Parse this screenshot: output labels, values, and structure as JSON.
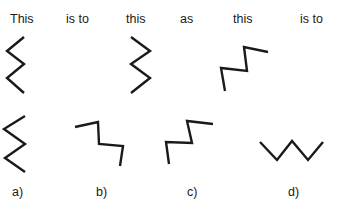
{
  "analogy": {
    "words": [
      "This",
      "is to",
      "this",
      "as",
      "this",
      "is to"
    ]
  },
  "options": [
    {
      "label": "a)"
    },
    {
      "label": "b)"
    },
    {
      "label": "c)"
    },
    {
      "label": "d)"
    }
  ],
  "shapes": {
    "stem_1": "24,37 7,51 24,64 7,78 24,93",
    "stem_2": "131,37 150,51 131,64 150,78 131,93",
    "stem_3": "225,91 221,68 247,71 244,47 268,52",
    "option_a": "25,116 4,129 25,144 5,158 25,172",
    "option_b": "75,127 98,122 99,144 123,146 120,166",
    "option_c": "169,164 166,142 192,143 187,121 213,124",
    "option_d": "260,142 277,160 292,141 308,160 323,142"
  },
  "stroke_color": "#1a1a1a"
}
